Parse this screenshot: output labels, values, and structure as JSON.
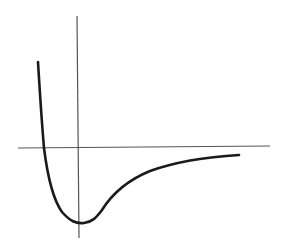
{
  "diagram": {
    "type": "potential-energy-curve",
    "colors": {
      "background": "#ffffff",
      "axis": "#555555",
      "curve": "#1a1a1a"
    },
    "axes": {
      "horizontal": {
        "x1": 18,
        "y1": 148,
        "x2": 270,
        "y2": 146
      },
      "vertical": {
        "x1": 77,
        "y1": 16,
        "x2": 79,
        "y2": 238
      }
    },
    "curve": {
      "path": "M38,62 C40,95 42,125 44,148 C47,172 52,198 62,212 C70,221 76,224 84,223 C92,222 96,218 102,210 C112,194 128,180 150,171 C175,162 205,157 239,155"
    },
    "labels": []
  }
}
